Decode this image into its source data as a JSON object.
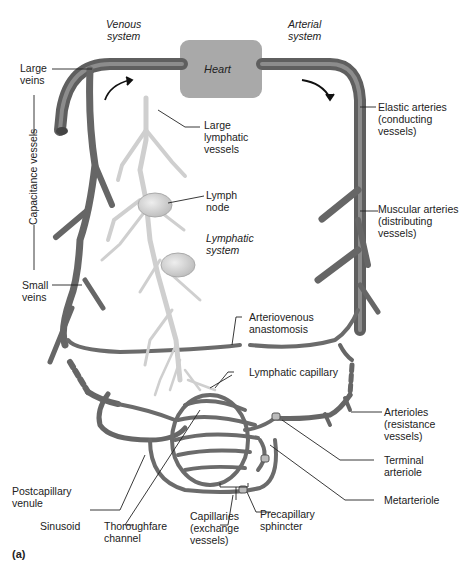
{
  "figure": {
    "panel_label": "(a)",
    "colors": {
      "vessel": "#6b6b6b",
      "vessel_highlight": "#9a9a9a",
      "heart": "#a9a9a9",
      "lymphatic": "#d2d2d2",
      "lymph_node": "#c4c4c4",
      "leader_line": "#222222",
      "background": "#ffffff"
    },
    "headers": {
      "venous": "Venous\nsystem",
      "arterial": "Arterial\nsystem",
      "lymphatic": "Lymphatic\nsystem"
    },
    "heart": "Heart",
    "left_labels": {
      "large_veins": "Large\nveins",
      "capacitance": "Capacitance vessels",
      "small_veins": "Small\nveins",
      "postcapillary": "Postcapillary\nvenule",
      "sinusoid": "Sinusoid"
    },
    "center_labels": {
      "large_lymphatic": "Large\nlymphatic\nvessels",
      "lymph_node": "Lymph\nnode",
      "av_anastomosis": "Arteriovenous\nanastomosis",
      "lymphatic_capillary": "Lymphatic capillary",
      "thoroughfare": "Thoroughfare\nchannel",
      "capillaries": "Capillaries\n(exchange\nvessels)",
      "precapillary": "Precapillary\nsphincter"
    },
    "right_labels": {
      "elastic": "Elastic arteries\n(conducting\nvessels)",
      "muscular": "Muscular arteries\n(distributing\nvessels)",
      "arterioles": "Arterioles\n(resistance\nvessels)",
      "terminal": "Terminal\narteriole",
      "metarteriole": "Metarteriole"
    }
  }
}
